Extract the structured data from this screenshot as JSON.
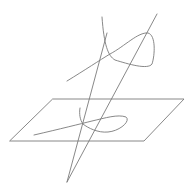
{
  "diagram": {
    "type": "projection-of-nodal-curve",
    "colors": {
      "line": "#7a7a7a",
      "background": "#ffffff"
    },
    "plane": {
      "points": "53,99 184,99 144,141 10,141"
    },
    "apex": {
      "x": 67,
      "y": 182
    },
    "rays": [
      {
        "name": "ray-through-node",
        "d": "M67,182 L107,33"
      },
      {
        "name": "ray-through-loop",
        "d": "M67,182 L157,14"
      }
    ],
    "space_curve": {
      "d": "M67,81 C85,70 100,60 110,54 C125,46 138,32 148,33 C156,35 155,55 152,64 C148,70 128,64 115,60 C108,56 104,45 102,17"
    },
    "plane_curve": {
      "d": "M34,135 C60,129 80,124 92,121 C105,118 118,114 126,117 C131,121 120,131 108,132 C98,133 88,128 83,124 C80,120 79,114 80,108"
    }
  }
}
